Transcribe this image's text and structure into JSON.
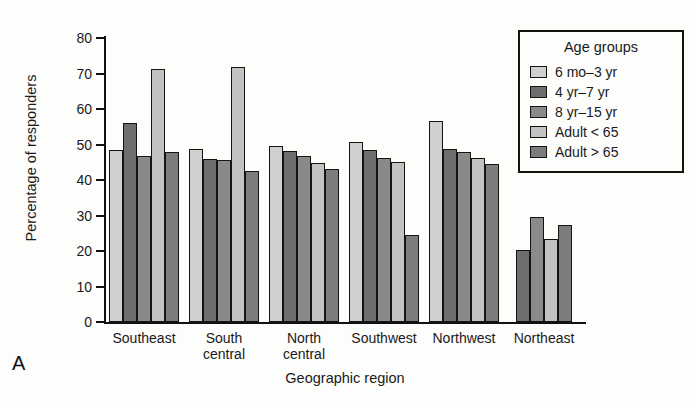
{
  "panel": {
    "label": "A"
  },
  "legend": {
    "title": "Age groups",
    "items": [
      {
        "label": "6 mo–3 yr",
        "color": "#cfcfcf"
      },
      {
        "label": "4 yr–7 yr",
        "color": "#6e6e6e"
      },
      {
        "label": "8 yr–15 yr",
        "color": "#8a8a8a"
      },
      {
        "label": "Adult < 65",
        "color": "#c2c2c2"
      },
      {
        "label": "Adult > 65",
        "color": "#7c7c7c"
      }
    ]
  },
  "chart_data": {
    "type": "bar",
    "title": "",
    "xlabel": "Geographic region",
    "ylabel": "Percentage of responders",
    "categories": [
      "Southeast",
      "South\ncentral",
      "North\ncentral",
      "Southwest",
      "Northwest",
      "Northeast"
    ],
    "ylim": [
      0,
      80
    ],
    "yticks": [
      0,
      10,
      20,
      30,
      40,
      50,
      60,
      70,
      80
    ],
    "grid": false,
    "legend_position": "top-right",
    "series": [
      {
        "name": "6 mo–3 yr",
        "color": "#cfcfcf",
        "values": [
          48.5,
          48.8,
          49.7,
          50.8,
          56.5,
          null
        ]
      },
      {
        "name": "4 yr–7 yr",
        "color": "#6e6e6e",
        "values": [
          56.2,
          46.0,
          48.2,
          48.5,
          48.7,
          20.4
        ]
      },
      {
        "name": "8 yr–15 yr",
        "color": "#8a8a8a",
        "values": [
          46.7,
          45.5,
          46.7,
          46.3,
          48.0,
          29.6
        ]
      },
      {
        "name": "Adult < 65",
        "color": "#c2c2c2",
        "values": [
          71.3,
          71.8,
          44.9,
          45.0,
          46.2,
          23.5
        ]
      },
      {
        "name": "Adult > 65",
        "color": "#7c7c7c",
        "values": [
          47.9,
          42.4,
          43.0,
          24.5,
          44.6,
          27.3
        ]
      }
    ]
  }
}
